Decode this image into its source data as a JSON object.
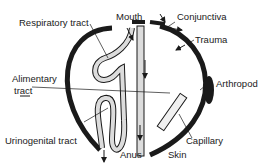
{
  "diagram": {
    "labels": {
      "respiratory": "Respiratory tract",
      "mouth": "Mouth",
      "conjunctiva": "Conjunctiva",
      "trauma": "Trauma",
      "alimentary_1": "Alimentary",
      "alimentary_2": "tract",
      "arthropod": "Arthropod",
      "urinogenital": "Urinogenital tract",
      "capillary": "Capillary",
      "anus": "Anus",
      "skin": "Skin"
    },
    "colors": {
      "body_wall": "#1a1a1a",
      "tract_fill": "#dcdcdc",
      "background": "#ffffff"
    }
  }
}
